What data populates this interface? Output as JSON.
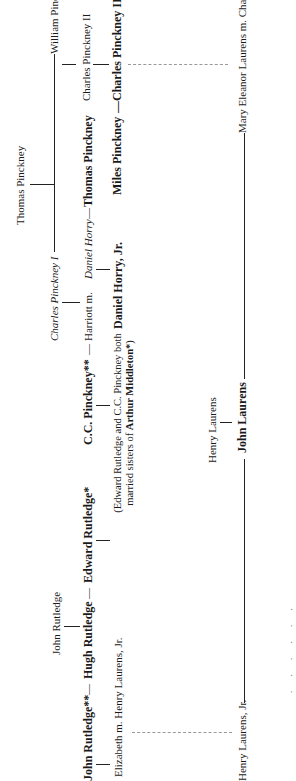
{
  "diagram": {
    "type": "family-tree",
    "orientation": "rotated-90-ccw",
    "pinckney": {
      "thomas_pinckney_root": "Thomas Pinckney",
      "william_pinckney": "William Pinckney",
      "charles_pinckney_ii": "Charles Pinckney II",
      "miles_pinckney": "Miles Pinckney",
      "charles_pinckney_iii": "Charles Pinckney III**",
      "charles_pinckney_i": "Charles Pinckney I",
      "harriott": "Harriott m.",
      "daniel_horry": "Daniel Horry",
      "thomas_pinckney_son": "Thomas Pinckney",
      "daniel_horry_jr": "Daniel Horry, Jr.",
      "cc_pinckney": "C.C. Pinckney**"
    },
    "note": {
      "line1": "(Edward Rutledge and C.C. Pinckney both",
      "line2_prefix": "married sisters of ",
      "line2_bold": "Arthur Middleton*",
      "line2_suffix": ")"
    },
    "laurens": {
      "henry_laurens": "Henry Laurens",
      "john_laurens": "John Laurens",
      "mary_eleanor": "Mary Eleanor Laurens m. Charles Pinckney III",
      "henry_laurens_jr": "Henry Laurens, Jr."
    },
    "rutledge": {
      "john_rutledge_root": "John Rutledge",
      "john_rutledge": "John Rutledge**",
      "hugh_rutledge": "Hugh Rutledge",
      "edward_rutledge": "Edward Rutledge*",
      "elizabeth": "Elizabeth m. Henry Laurens, Jr."
    },
    "separators": {
      "dash": "—"
    },
    "caption_fragment": ". . . .  . ."
  }
}
